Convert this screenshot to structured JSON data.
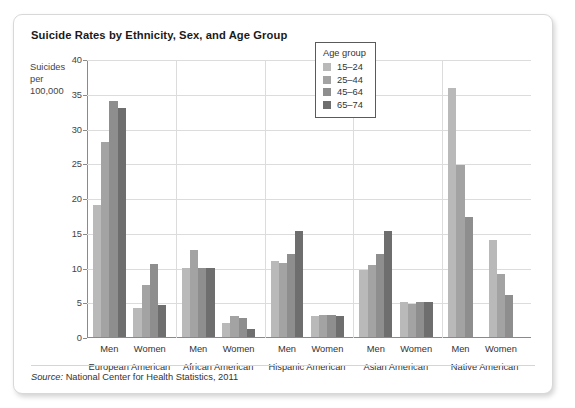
{
  "card": {
    "title": "Suicide Rates by Ethnicity, Sex, and Age Group",
    "source_prefix": "Source:",
    "source_text": "National Center for Health Statistics, 2011"
  },
  "legend": {
    "title": "Age group",
    "position": "inside-top-right"
  },
  "colors": {
    "age_15_24": "#b9b9b9",
    "age_25_44": "#a3a3a3",
    "age_45_64": "#8e8e8e",
    "age_65_74": "#6e6e6e",
    "gridline": "#dcdcdc",
    "axis": "#8a8a8a",
    "card_border": "#d8d8d8",
    "text": "#333333"
  },
  "chart_data": {
    "type": "bar",
    "title": "Suicide Rates by Ethnicity, Sex, and Age Group",
    "xlabel": "",
    "ylabel": "Suicides per 100,000",
    "ylim": [
      0,
      40
    ],
    "yticks": [
      0,
      5,
      10,
      15,
      20,
      25,
      30,
      35,
      40
    ],
    "grid": true,
    "legend_title": "Age group",
    "legend_position": "inside-top-right",
    "series": [
      {
        "name": "15–24",
        "color": "#b9b9b9"
      },
      {
        "name": "25–44",
        "color": "#a3a3a3"
      },
      {
        "name": "45–64",
        "color": "#8e8e8e"
      },
      {
        "name": "65–74",
        "color": "#6e6e6e"
      }
    ],
    "groups": [
      {
        "ethnicity": "European American",
        "sexes": [
          {
            "sex": "Men",
            "values": [
              19.0,
              28.0,
              34.0,
              33.0
            ]
          },
          {
            "sex": "Women",
            "values": [
              4.2,
              7.5,
              10.5,
              4.6
            ]
          }
        ]
      },
      {
        "ethnicity": "African American",
        "sexes": [
          {
            "sex": "Men",
            "values": [
              10.0,
              12.5,
              10.0,
              10.0
            ]
          },
          {
            "sex": "Women",
            "values": [
              2.0,
              3.0,
              2.8,
              1.2
            ]
          }
        ]
      },
      {
        "ethnicity": "Hispanic American",
        "sexes": [
          {
            "sex": "Men",
            "values": [
              11.0,
              10.7,
              12.0,
              15.2
            ]
          },
          {
            "sex": "Women",
            "values": [
              3.0,
              3.2,
              3.1,
              3.0
            ]
          }
        ]
      },
      {
        "ethnicity": "Asian American",
        "sexes": [
          {
            "sex": "Men",
            "values": [
              9.7,
              10.3,
              12.0,
              15.2
            ]
          },
          {
            "sex": "Women",
            "values": [
              5.0,
              4.7,
              5.0,
              5.1
            ]
          }
        ]
      },
      {
        "ethnicity": "Native American",
        "sexes": [
          {
            "sex": "Men",
            "values": [
              35.8,
              24.7,
              17.3,
              null
            ]
          },
          {
            "sex": "Women",
            "values": [
              14.0,
              9.0,
              6.1,
              null
            ]
          }
        ]
      }
    ]
  }
}
